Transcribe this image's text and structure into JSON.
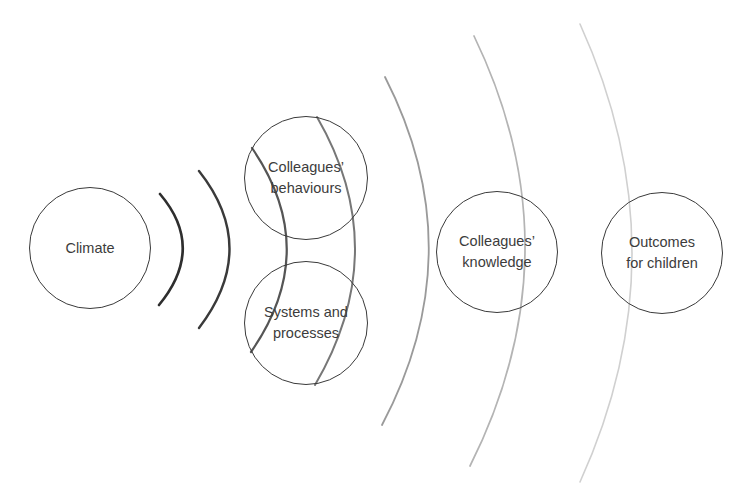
{
  "diagram": {
    "type": "concentric-influence-ripple",
    "nodes": [
      {
        "id": "climate",
        "label": "Climate",
        "cx": 90,
        "cy": 248,
        "r": 61
      },
      {
        "id": "behaviours",
        "label": "Colleagues’\nbehaviours",
        "cx": 306,
        "cy": 178,
        "r": 62
      },
      {
        "id": "systems",
        "label": "Systems and\nprocesses",
        "cx": 306,
        "cy": 323,
        "r": 62
      },
      {
        "id": "knowledge",
        "label": "Colleagues’\nknowledge",
        "cx": 497,
        "cy": 252,
        "r": 61
      },
      {
        "id": "outcomes",
        "label": "Outcomes\nfor children",
        "cx": 662,
        "cy": 253,
        "r": 61
      }
    ],
    "ripples": [
      {
        "id": "ripple-1",
        "start": [
          160,
          194
        ],
        "control": [
          206,
          248
        ],
        "end": [
          159,
          305
        ],
        "color": "#2e2e2e",
        "width": 2.6
      },
      {
        "id": "ripple-2",
        "start": [
          199,
          171
        ],
        "control": [
          260,
          248
        ],
        "end": [
          199,
          328
        ],
        "color": "#3a3a3a",
        "width": 2.4
      },
      {
        "id": "ripple-3",
        "start": [
          252,
          148
        ],
        "control": [
          322,
          250
        ],
        "end": [
          251,
          352
        ],
        "color": "#555555",
        "width": 2.2
      },
      {
        "id": "ripple-4",
        "start": [
          317,
          117
        ],
        "control": [
          394,
          250
        ],
        "end": [
          315,
          385
        ],
        "color": "#777777",
        "width": 2.0
      },
      {
        "id": "ripple-5",
        "start": [
          385,
          77
        ],
        "control": [
          474,
          251
        ],
        "end": [
          382,
          425
        ],
        "color": "#9a9a9a",
        "width": 1.8
      },
      {
        "id": "ripple-6",
        "start": [
          474,
          36
        ],
        "control": [
          578,
          251
        ],
        "end": [
          470,
          466
        ],
        "color": "#b4b4b4",
        "width": 1.7
      },
      {
        "id": "ripple-7",
        "start": [
          580,
          24
        ],
        "control": [
          684,
          253
        ],
        "end": [
          580,
          482
        ],
        "color": "#d0d0d0",
        "width": 1.6
      }
    ]
  }
}
